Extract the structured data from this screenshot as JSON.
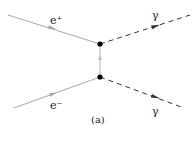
{
  "diagram": {
    "type": "feynman-diagram",
    "caption": "(a)",
    "process": "e+ e- -> gamma gamma (t-channel)",
    "colors": {
      "fermion_line": "#a8a8a8",
      "photon_line": "#333333",
      "vertex": "#000000",
      "text": "#222222"
    },
    "vertices": [
      {
        "id": "v1",
        "x": 100,
        "y": 44
      },
      {
        "id": "v2",
        "x": 100,
        "y": 77
      }
    ],
    "lines": [
      {
        "id": "positron",
        "kind": "fermion",
        "from": [
          8,
          15
        ],
        "to": [
          100,
          44
        ],
        "label": "e⁺"
      },
      {
        "id": "electron",
        "kind": "fermion",
        "from": [
          14,
          108
        ],
        "to": [
          100,
          77
        ],
        "label": "e⁻"
      },
      {
        "id": "propagator",
        "kind": "fermion",
        "from": [
          100,
          77
        ],
        "to": [
          100,
          44
        ],
        "label": ""
      },
      {
        "id": "photon-upper",
        "kind": "photon",
        "from": [
          100,
          44
        ],
        "to": [
          190,
          15
        ],
        "label": "γ"
      },
      {
        "id": "photon-lower",
        "kind": "photon",
        "from": [
          100,
          77
        ],
        "to": [
          184,
          108
        ],
        "label": "γ"
      }
    ],
    "labels": {
      "positron": "e⁺",
      "electron": "e⁻",
      "photon_upper": "γ",
      "photon_lower": "γ",
      "caption": "(a)"
    }
  }
}
